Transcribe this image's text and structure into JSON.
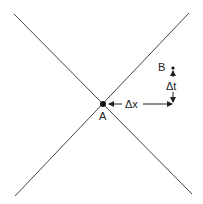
{
  "diagram": {
    "type": "spacetime-light-cone",
    "colors": {
      "background": "#ffffff",
      "ink": "#222222",
      "line": "#444444"
    },
    "lines": [
      {
        "name": "light-line-descending",
        "x1": 14,
        "y1": 14,
        "x2": 192,
        "y2": 194
      },
      {
        "name": "light-line-ascending",
        "x1": 189,
        "y1": 13,
        "x2": 15,
        "y2": 196
      }
    ],
    "points": {
      "A": {
        "label": "A",
        "x": 103,
        "y": 104
      },
      "B": {
        "label": "B",
        "x": 173,
        "y": 68
      }
    },
    "annotations": {
      "dx": {
        "label": "Δx"
      },
      "dt": {
        "label": "Δt"
      }
    }
  }
}
